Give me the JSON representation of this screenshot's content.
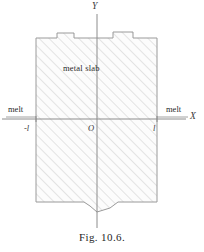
{
  "figure": {
    "caption": "Fig. 10.6.",
    "body_label": "metal  slab",
    "axes": {
      "x_name": "X",
      "y_name": "Y",
      "origin_name": "O"
    },
    "ticks": {
      "left": "-l",
      "right": "l"
    },
    "regions": {
      "melt_left": "melt",
      "melt_right": "melt"
    },
    "colors": {
      "ink": "#2b2b2b",
      "axis": "#8c8c8c",
      "outline": "#9a9a9a",
      "hatch": "#c9c9c9",
      "fill": "#fbfbfb",
      "background": "#ffffff"
    },
    "geometry": {
      "slab_left_px": 36,
      "slab_right_px": 157,
      "slab_top_px": 38,
      "slab_bottom_px": 202,
      "axis_y_px": 119,
      "axis_x_px": 97,
      "hatch_angle_deg": 45
    }
  }
}
